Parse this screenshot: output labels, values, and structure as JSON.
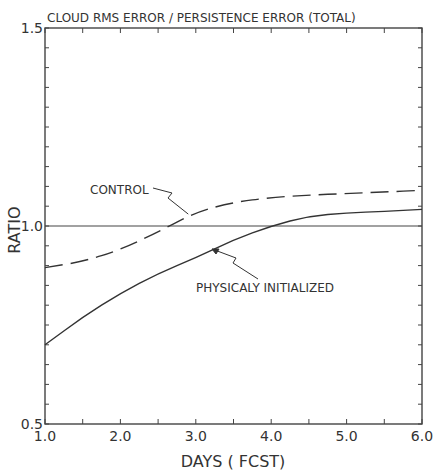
{
  "chart_data": {
    "type": "line",
    "title": "CLOUD RMS ERROR / PERSISTENCE ERROR (TOTAL)",
    "xlabel": "DAYS ( FCST)",
    "ylabel": "RATIO",
    "xlim": [
      1.0,
      6.0
    ],
    "ylim": [
      0.5,
      1.5
    ],
    "xticks": [
      "1.0",
      "2.0",
      "3.0",
      "4.0",
      "5.0",
      "6.0"
    ],
    "xtick_values": [
      1,
      2,
      3,
      4,
      5,
      6
    ],
    "xminor_step": 0.5,
    "yticks": [
      "0.5",
      "1.0",
      "1.5"
    ],
    "ytick_values": [
      0.5,
      1.0,
      1.5
    ],
    "yminor_step": 0.05,
    "grid": false,
    "reference_line": 1.0,
    "x": [
      1.0,
      1.5,
      2.0,
      2.5,
      3.0,
      3.5,
      4.0,
      4.5,
      5.0,
      5.5,
      6.0
    ],
    "series": [
      {
        "name": "CONTROL",
        "style": "dashed",
        "values": [
          0.895,
          0.91,
          0.94,
          0.985,
          1.035,
          1.06,
          1.072,
          1.078,
          1.082,
          1.086,
          1.09
        ]
      },
      {
        "name": "PHYSICALY INITIALIZED",
        "style": "solid",
        "values": [
          0.7,
          0.77,
          0.83,
          0.88,
          0.92,
          0.965,
          1.0,
          1.025,
          1.033,
          1.037,
          1.042
        ]
      }
    ],
    "annotations": [
      {
        "text": "CONTROL",
        "points_to_series": "CONTROL",
        "at_x": 2.9
      },
      {
        "text": "PHYSICALY INITIALIZED",
        "points_to_series": "PHYSICALY INITIALIZED",
        "at_x": 3.5
      }
    ]
  }
}
